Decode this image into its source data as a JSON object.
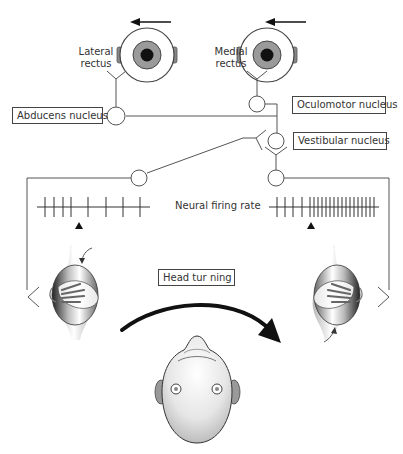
{
  "labels": {
    "lateral_rectus": [
      "Lateral",
      "rectus"
    ],
    "medial_rectus": [
      "Medial",
      "rectus"
    ],
    "abducens_nucleus": "Abducens nucleus",
    "oculomotor_nucleus": "Oculomotor nucleus",
    "vestibular_nucleus": "Vestibular nucleus",
    "neural_firing_rate": "Neural firing rate",
    "head_turning": "Head tur ning"
  },
  "firing_rate": {
    "left": {
      "description": "sparse firing (decreased)",
      "tick_count": 8
    },
    "right": {
      "description": "dense firing (increased)",
      "tick_count": 24
    }
  },
  "colors": {
    "line": "#555555",
    "text": "#333333",
    "iris": "#9a9a9a",
    "pupil": "#111111",
    "arrow": "#111111"
  }
}
